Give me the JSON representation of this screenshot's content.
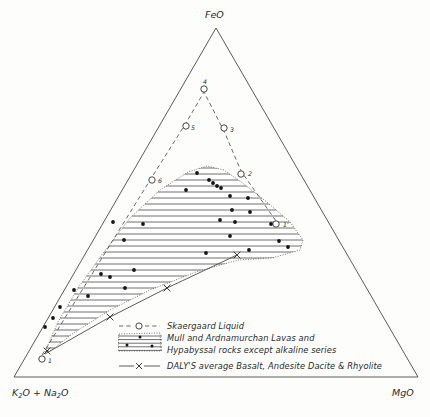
{
  "figure": {
    "background_color": "#fdfdfc",
    "line_color": "#4a4a4a"
  },
  "apex_labels": {
    "top": "FeO",
    "bottom_left_main": "K",
    "bottom_left_sub1": "2",
    "bottom_left_mid": "O + Na",
    "bottom_left_sub2": "2",
    "bottom_left_end": "O",
    "bottom_right": "MgO"
  },
  "legend": {
    "items": [
      {
        "symbol": "dashed-line-open-circle",
        "label": "Skaergaard Liquid"
      },
      {
        "symbol": "hatched-swatch-with-dots",
        "label_line1": "Mull and Ardnamurchan Lavas and",
        "label_line2": "Hypabyssal rocks except alkaline series"
      },
      {
        "symbol": "solid-line-cross",
        "label": "DALY'S average Basalt, Andesite Dacite & Rhyolite"
      }
    ]
  },
  "chart_data": {
    "type": "scatter",
    "xlabel": "",
    "ylabel": "",
    "axes": {
      "top_apex": "FeO",
      "left_apex": "K2O + Na2O",
      "right_apex": "MgO"
    },
    "grid": false,
    "legend_position": "inside-bottom-center",
    "series": [
      {
        "name": "Skaergaard Liquid",
        "marker": "open-circle",
        "line": "dashed",
        "point_labels": [
          "1",
          "6",
          "5",
          "4",
          "3",
          "2",
          "1'"
        ],
        "pixel_points": [
          [
            42,
            359
          ],
          [
            152,
            180
          ],
          [
            186,
            126
          ],
          [
            204,
            89
          ],
          [
            224,
            128
          ],
          [
            241,
            174
          ],
          [
            276,
            224
          ]
        ],
        "path_order": [
          "1",
          "6",
          "5",
          "4",
          "3",
          "2",
          "1'"
        ]
      },
      {
        "name": "Mull and Ardnamurchan Lavas and Hypabyssal rocks except alkaline series",
        "marker": "filled-square-dot",
        "field": "hatched",
        "pixel_points": [
          [
            197,
            173
          ],
          [
            209,
            180
          ],
          [
            213,
            183
          ],
          [
            217,
            186
          ],
          [
            221,
            188
          ],
          [
            230,
            196
          ],
          [
            248,
            198
          ],
          [
            186,
            190
          ],
          [
            232,
            210
          ],
          [
            250,
            212
          ],
          [
            220,
            220
          ],
          [
            113,
            222
          ],
          [
            143,
            224
          ],
          [
            235,
            222
          ],
          [
            271,
            224
          ],
          [
            124,
            240
          ],
          [
            230,
            236
          ],
          [
            279,
            241
          ],
          [
            249,
            250
          ],
          [
            288,
            247
          ],
          [
            206,
            253
          ],
          [
            134,
            270
          ],
          [
            101,
            274
          ],
          [
            110,
            277
          ],
          [
            125,
            288
          ],
          [
            74,
            290
          ],
          [
            88,
            296
          ],
          [
            60,
            307
          ],
          [
            53,
            318
          ],
          [
            45,
            327
          ]
        ]
      },
      {
        "name": "DALY'S average Basalt, Andesite Dacite & Rhyolite",
        "marker": "cross",
        "line": "solid",
        "pixel_points": [
          [
            47,
            351
          ],
          [
            110,
            317
          ],
          [
            167,
            288
          ],
          [
            237,
            255
          ]
        ]
      }
    ]
  }
}
